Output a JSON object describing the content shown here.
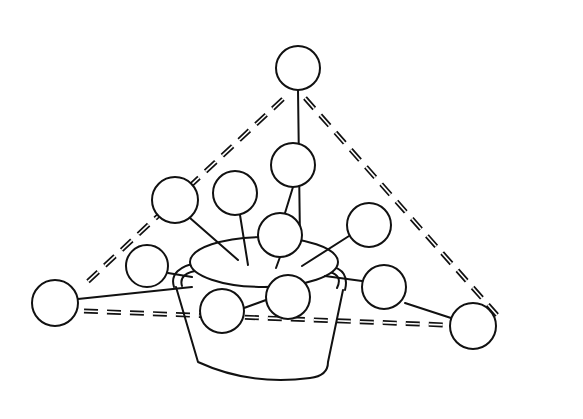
{
  "figure": {
    "colors": {
      "ink": "#111111",
      "background": "#ffffff"
    },
    "balls": [
      {
        "id": "top",
        "cx": 298,
        "cy": 68,
        "r": 22
      },
      {
        "id": "upper-right-inner",
        "cx": 293,
        "cy": 165,
        "r": 22
      },
      {
        "id": "upper-middle",
        "cx": 235,
        "cy": 193,
        "r": 22
      },
      {
        "id": "upper-left",
        "cx": 175,
        "cy": 200,
        "r": 23
      },
      {
        "id": "center",
        "cx": 280,
        "cy": 235,
        "r": 22
      },
      {
        "id": "right-upper",
        "cx": 369,
        "cy": 225,
        "r": 22
      },
      {
        "id": "left-mid",
        "cx": 147,
        "cy": 266,
        "r": 21
      },
      {
        "id": "far-left",
        "cx": 55,
        "cy": 303,
        "r": 23
      },
      {
        "id": "right-mid",
        "cx": 384,
        "cy": 287,
        "r": 22
      },
      {
        "id": "front-right",
        "cx": 288,
        "cy": 297,
        "r": 22
      },
      {
        "id": "front-left",
        "cx": 222,
        "cy": 311,
        "r": 22
      },
      {
        "id": "far-right",
        "cx": 473,
        "cy": 326,
        "r": 23
      }
    ]
  }
}
